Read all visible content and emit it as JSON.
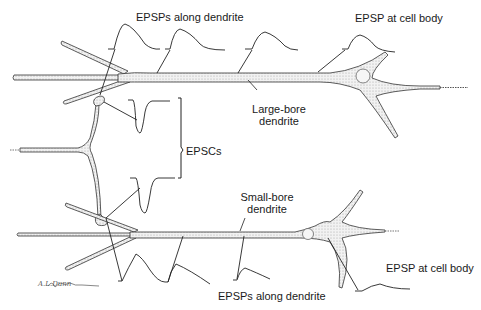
{
  "figure": {
    "type": "neuron-dendrite-diagram",
    "colors": {
      "outline": "#333333",
      "fill": "#e8e8e8",
      "text": "#1a1a1a",
      "trace": "#222222"
    }
  },
  "labels": {
    "top_epsps_along_dendrite": "EPSPs along dendrite",
    "top_epsp_at_cell_body": "EPSP at cell body",
    "large_bore_line1": "Large-bore",
    "large_bore_line2": "dendrite",
    "epscs": "EPSCs",
    "small_bore_line1": "Small-bore",
    "small_bore_line2": "dendrite",
    "bottom_epsp_at_cell_body": "EPSP at cell body",
    "bottom_epsps_along_dendrite": "EPSPs along dendrite"
  },
  "signature": "A.L.Dunn"
}
